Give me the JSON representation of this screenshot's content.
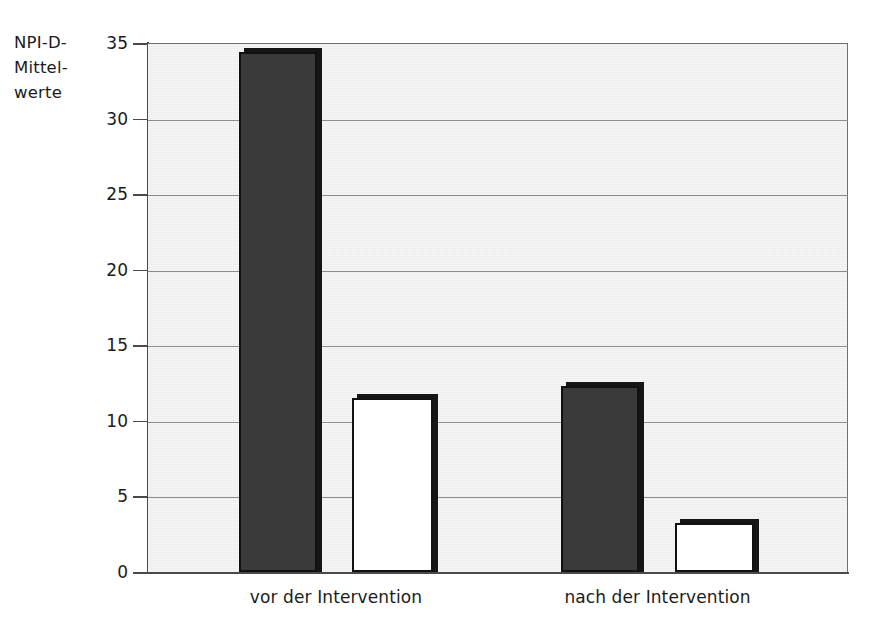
{
  "chart_data": {
    "type": "bar",
    "title": "",
    "subtitle": "",
    "ylabel": "NPI-D-\nMittel-\nwerte",
    "ylabel_lines": [
      "NPI-D-",
      "Mittel-",
      "werte"
    ],
    "xlabel": "",
    "categories": [
      "vor der Intervention",
      "nach der Intervention"
    ],
    "series": [
      {
        "name": "dunkel",
        "color": "#3a3a3a",
        "values": [
          34.4,
          12.3
        ]
      },
      {
        "name": "hell",
        "color": "#ffffff",
        "values": [
          11.5,
          3.25
        ]
      }
    ],
    "ylim": [
      0,
      35
    ],
    "yticks": [
      0,
      5,
      10,
      15,
      20,
      25,
      30,
      35
    ],
    "ytick_labels": [
      "0",
      "5",
      "10",
      "15",
      "20",
      "25",
      "30",
      "35"
    ],
    "grid": true,
    "grid_axis": "y",
    "legend": "none",
    "plot_background": "#ececec",
    "gridline_color": "#8d8d8d",
    "axis_color": "#4a4a4a",
    "bar_border_color": "#111111"
  },
  "axis": {
    "y_caption": "NPI-D-\nMittel-\nwerte"
  }
}
